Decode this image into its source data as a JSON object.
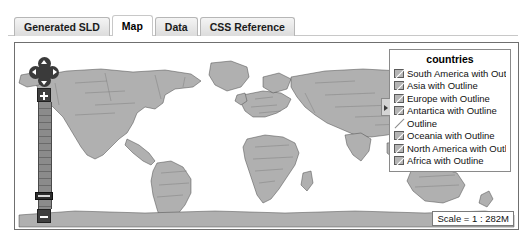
{
  "tabs": [
    {
      "label": "Generated SLD",
      "active": false
    },
    {
      "label": "Map",
      "active": true
    },
    {
      "label": "Data",
      "active": false
    },
    {
      "label": "CSS Reference",
      "active": false
    }
  ],
  "map": {
    "legend": {
      "title": "countries",
      "items": [
        {
          "label": "South America  with Outline",
          "swatch": "fill-with-outline"
        },
        {
          "label": "Asia  with Outline",
          "swatch": "fill-with-outline"
        },
        {
          "label": "Europe  with Outline",
          "swatch": "fill-with-outline"
        },
        {
          "label": "Antartica  with Outline",
          "swatch": "fill-with-outline"
        },
        {
          "label": "Outline",
          "swatch": "line-only"
        },
        {
          "label": "Oceania  with Outline",
          "swatch": "fill-with-outline"
        },
        {
          "label": "North America  with Outline",
          "swatch": "fill-with-outline"
        },
        {
          "label": "Africa  with Outline",
          "swatch": "fill-with-outline"
        }
      ],
      "collapse_handle": "legend-collapse-handle"
    },
    "scale_label": "Scale = 1 : 282M",
    "navigation": {
      "pan_up": "pan-north",
      "pan_down": "pan-south",
      "pan_left": "pan-west",
      "pan_right": "pan-east",
      "zoom_in": "+",
      "zoom_out": "−"
    },
    "colors": {
      "ocean": "#ffffff",
      "land": "#b0b0b0",
      "outline": "#4a4a4a",
      "panel_border": "#6f6f6f"
    }
  }
}
